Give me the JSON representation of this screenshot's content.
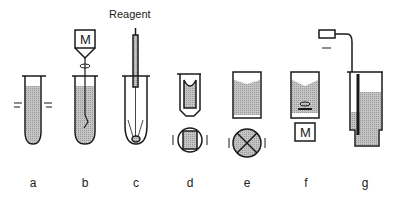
{
  "diagram": {
    "annotation": "Reagent",
    "motor_label": "M",
    "panels": [
      {
        "id": "a",
        "label": "a",
        "description": "tube shaken horizontally"
      },
      {
        "id": "b",
        "label": "b",
        "description": "tube with motor-driven stirrer"
      },
      {
        "id": "c",
        "label": "c",
        "description": "reagent injected through capillary"
      },
      {
        "id": "d",
        "label": "d",
        "description": "cuvette rocked, top view"
      },
      {
        "id": "e",
        "label": "e",
        "description": "vessel with cross stirrer"
      },
      {
        "id": "f",
        "label": "f",
        "description": "magnetic stirrer driven by motor"
      },
      {
        "id": "g",
        "label": "g",
        "description": "pneumatic pump mixing"
      }
    ],
    "colors": {
      "fill": "#bdbdbd",
      "stroke": "#1a1a1a"
    }
  }
}
